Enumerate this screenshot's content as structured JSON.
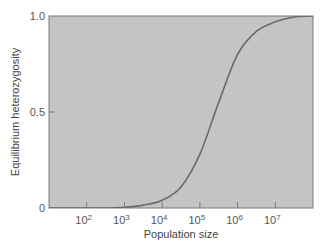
{
  "chart_data": {
    "type": "line",
    "title": "",
    "xlabel": "Population size",
    "ylabel": "Equilibrium heterozygosity",
    "x_scale": "log10",
    "xlim_log10": [
      1.0,
      8.0
    ],
    "ylim": [
      0,
      1.0
    ],
    "grid": false,
    "legend": null,
    "x_ticks": [
      {
        "exp": 2,
        "label": "10",
        "sup": "2"
      },
      {
        "exp": 3,
        "label": "10",
        "sup": "3"
      },
      {
        "exp": 4,
        "label": "10",
        "sup": "4"
      },
      {
        "exp": 5,
        "label": "10",
        "sup": "5"
      },
      {
        "exp": 6,
        "label": "10",
        "sup": "6"
      },
      {
        "exp": 7,
        "label": "10",
        "sup": "7"
      }
    ],
    "y_ticks": [
      {
        "value": 0,
        "label": "0"
      },
      {
        "value": 0.5,
        "label": "0.5"
      },
      {
        "value": 1.0,
        "label": "1.0"
      }
    ],
    "series": [
      {
        "name": "Equilibrium heterozygosity",
        "x_log10": [
          1.0,
          2.0,
          2.5,
          3.0,
          3.5,
          4.0,
          4.5,
          5.0,
          5.5,
          6.0,
          6.5,
          7.0,
          7.5,
          8.0
        ],
        "values": [
          0.0,
          0.0,
          0.0,
          0.004,
          0.015,
          0.04,
          0.11,
          0.28,
          0.55,
          0.8,
          0.92,
          0.97,
          0.995,
          1.0
        ]
      }
    ]
  },
  "colors": {
    "plot_background": "#c4c4c4",
    "frame": "#7a7a7a",
    "curve": "#6b6b6b",
    "text": "#555555"
  }
}
